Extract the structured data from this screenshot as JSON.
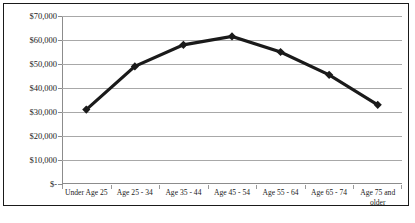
{
  "chart_data": {
    "type": "line",
    "title": "",
    "subtitle": "",
    "xlabel": "",
    "ylabel": "",
    "categories": [
      "Under Age 25",
      "Age 25 - 34",
      "Age 35 - 44",
      "Age 45 - 54",
      "Age 55 - 64",
      "Age 65 - 74",
      "Age 75 and older"
    ],
    "values": [
      31000,
      49000,
      58000,
      61500,
      55000,
      45500,
      33000
    ],
    "y_tick_labels": [
      "$70,000",
      "$60,000",
      "$50,000",
      "$40,000",
      "$30,000",
      "$20,000",
      "$10,000",
      "$-"
    ],
    "y_tick_values": [
      70000,
      60000,
      50000,
      40000,
      30000,
      20000,
      10000,
      0
    ],
    "ylim": [
      0,
      70000
    ],
    "grid": true,
    "legend": false,
    "legend_position": "none",
    "series_color": "#1a1a1a",
    "marker": "diamond",
    "gridline_color": "#a8a8a8",
    "plot_background": "#ffffff"
  },
  "caption": {
    "text": ""
  },
  "colors": {
    "border": "#1a1a1a",
    "axis": "#8c8c8c",
    "text": "#1b1b1b"
  }
}
